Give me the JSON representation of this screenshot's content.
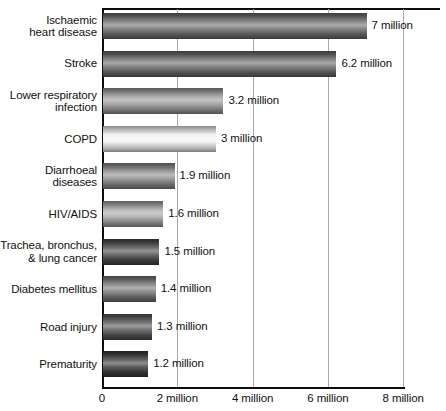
{
  "chart_data": {
    "type": "bar",
    "orientation": "horizontal",
    "title": "",
    "subtitle": "",
    "xlabel": "",
    "ylabel": "",
    "xlim": [
      0,
      9
    ],
    "grid": "vertical gridlines at 2, 4, 6, 8 million",
    "legend": "none",
    "units": "million",
    "categories": [
      "Ischaemic\nheart disease",
      "Stroke",
      "Lower respiratory\ninfection",
      "COPD",
      "Diarrhoeal\ndiseases",
      "HIV/AIDS",
      "Trachea, bronchus,\n& lung cancer",
      "Diabetes mellitus",
      "Road injury",
      "Prematurity"
    ],
    "values": [
      7,
      6.2,
      3.2,
      3,
      1.9,
      1.6,
      1.5,
      1.4,
      1.3,
      1.2
    ],
    "data_labels": [
      "7 million",
      "6.2 million",
      "3.2 million",
      "3 million",
      "1.9 million",
      "1.6 million",
      "1.5 million",
      "1.4 million",
      "1.3 million",
      "1.2 million"
    ],
    "bar_shades": [
      "#6e6e6e",
      "#6a6a6a",
      "#9a9a9a",
      "#f2f2f2",
      "#8a8a8a",
      "#a6a6a6",
      "#4a4a4a",
      "#777777",
      "#565656",
      "#3d3d3d"
    ],
    "xticks": [
      0,
      2,
      4,
      6,
      8
    ],
    "xtick_labels": [
      "0",
      "2 million",
      "4 million",
      "6 million",
      "8 million"
    ],
    "axis_color": "#0d0d0d",
    "grid_color": "#a9a9a9"
  }
}
